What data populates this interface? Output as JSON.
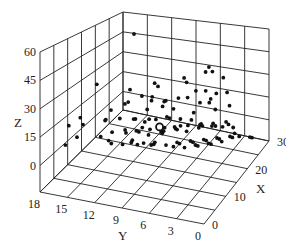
{
  "chart_data": {
    "type": "scatter3d",
    "title": "",
    "xlabel": "X",
    "ylabel": "Y",
    "zlabel": "Z",
    "xlim": [
      0,
      30
    ],
    "ylim": [
      0,
      18
    ],
    "zlim": [
      -14,
      60
    ],
    "x_ticks": [
      0,
      10,
      20,
      30
    ],
    "y_ticks": [
      18,
      15,
      12,
      9,
      6,
      3,
      0
    ],
    "z_ticks": [
      0,
      15,
      30,
      45,
      60
    ],
    "grid": true,
    "legend": null,
    "marker_color": "#111111",
    "grid_color": "#222222",
    "highlight_marker": {
      "x": 12,
      "y": 8,
      "z": 14,
      "style": "hollow-circle"
    },
    "points": [
      [
        22,
        14,
        55
      ],
      [
        20,
        4,
        40
      ],
      [
        22,
        5,
        40
      ],
      [
        21,
        3,
        36
      ],
      [
        24,
        6,
        34
      ],
      [
        18,
        3,
        30
      ],
      [
        22,
        8,
        31
      ],
      [
        23,
        8,
        27
      ],
      [
        20,
        6,
        27
      ],
      [
        15,
        9,
        33
      ],
      [
        17,
        10,
        32
      ],
      [
        14,
        12,
        30
      ],
      [
        8,
        14,
        38
      ],
      [
        12,
        10,
        30
      ],
      [
        10,
        11,
        28
      ],
      [
        14,
        8,
        26
      ],
      [
        12,
        12,
        24
      ],
      [
        16,
        10,
        25
      ],
      [
        10,
        13,
        22
      ],
      [
        14,
        10,
        20
      ],
      [
        18,
        9,
        21
      ],
      [
        20,
        7,
        22
      ],
      [
        24,
        6,
        22
      ],
      [
        26,
        4,
        20
      ],
      [
        22,
        5,
        18
      ],
      [
        21,
        4,
        16
      ],
      [
        19,
        6,
        15
      ],
      [
        5,
        15,
        22
      ],
      [
        4,
        16,
        18
      ],
      [
        6,
        15,
        17
      ],
      [
        8,
        13,
        19
      ],
      [
        10,
        12,
        18
      ],
      [
        12,
        11,
        16
      ],
      [
        13,
        10,
        14
      ],
      [
        14,
        9,
        15
      ],
      [
        15,
        8,
        16
      ],
      [
        16,
        8,
        14
      ],
      [
        17,
        7,
        13
      ],
      [
        18,
        6,
        12
      ],
      [
        12,
        10,
        12
      ],
      [
        11,
        9,
        10
      ],
      [
        13,
        8,
        9
      ],
      [
        14,
        8,
        11
      ],
      [
        15,
        7,
        10
      ],
      [
        16,
        6,
        8
      ],
      [
        17,
        7,
        9
      ],
      [
        18,
        5,
        10
      ],
      [
        19,
        5,
        8
      ],
      [
        20,
        4,
        9
      ],
      [
        21,
        4,
        6
      ],
      [
        22,
        3,
        8
      ],
      [
        23,
        3,
        5
      ],
      [
        10,
        8,
        8
      ],
      [
        11,
        7,
        6
      ],
      [
        12,
        6,
        7
      ],
      [
        13,
        6,
        5
      ],
      [
        14,
        5,
        6
      ],
      [
        15,
        5,
        4
      ],
      [
        16,
        4,
        5
      ],
      [
        17,
        4,
        3
      ],
      [
        18,
        3,
        4
      ],
      [
        19,
        3,
        2
      ],
      [
        20,
        2,
        3
      ],
      [
        21,
        2,
        1
      ],
      [
        22,
        2,
        2
      ],
      [
        8,
        10,
        10
      ],
      [
        9,
        9,
        8
      ],
      [
        9,
        11,
        12
      ],
      [
        7,
        12,
        14
      ],
      [
        6,
        13,
        12
      ],
      [
        10,
        10,
        5
      ],
      [
        11,
        11,
        4
      ],
      [
        12,
        9,
        3
      ],
      [
        13,
        9,
        2
      ],
      [
        14,
        7,
        1
      ],
      [
        15,
        6,
        0
      ],
      [
        16,
        5,
        1
      ],
      [
        17,
        5,
        -1
      ],
      [
        18,
        4,
        0
      ],
      [
        19,
        4,
        -2
      ],
      [
        20,
        3,
        -1
      ],
      [
        24,
        2,
        -3
      ],
      [
        25,
        1,
        -4
      ],
      [
        26,
        1,
        -6
      ],
      [
        12,
        12,
        9
      ],
      [
        13,
        11,
        8
      ],
      [
        14,
        11,
        6
      ],
      [
        15,
        10,
        7
      ],
      [
        16,
        9,
        5
      ],
      [
        17,
        9,
        4
      ],
      [
        18,
        8,
        6
      ],
      [
        19,
        8,
        3
      ],
      [
        20,
        7,
        5
      ],
      [
        21,
        6,
        3
      ],
      [
        22,
        6,
        4
      ],
      [
        23,
        5,
        2
      ],
      [
        24,
        4,
        1
      ],
      [
        25,
        3,
        0
      ],
      [
        9,
        13,
        6
      ],
      [
        10,
        13,
        3
      ],
      [
        11,
        12,
        2
      ],
      [
        26,
        6,
        14
      ],
      [
        27,
        4,
        10
      ],
      [
        25,
        7,
        12
      ],
      [
        20,
        10,
        14
      ],
      [
        19,
        11,
        18
      ],
      [
        21,
        9,
        12
      ],
      [
        23,
        9,
        16
      ],
      [
        11,
        14,
        14
      ],
      [
        7,
        16,
        8
      ],
      [
        6,
        17,
        4
      ],
      [
        16,
        12,
        10
      ],
      [
        18,
        11,
        8
      ]
    ]
  },
  "projection": {
    "base_front": [
      204,
      224
    ],
    "base_right": [
      269,
      141
    ],
    "base_left": [
      40,
      192
    ],
    "base_back": [
      123,
      110
    ],
    "top_front": [
      198,
      68
    ],
    "top_right": [
      269,
      29
    ],
    "top_left": [
      40,
      52
    ],
    "top_back": [
      123,
      12
    ]
  }
}
